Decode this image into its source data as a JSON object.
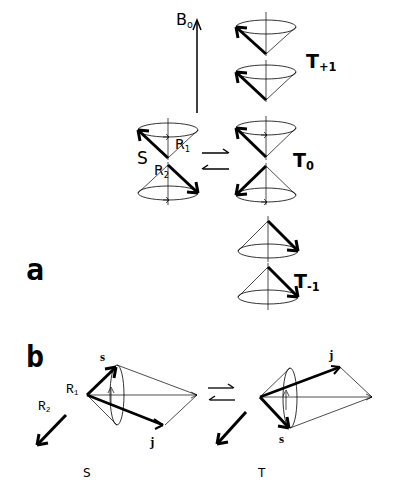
{
  "figure": {
    "panel_a": {
      "letter": "a",
      "field_label": "B",
      "field_sub": "o",
      "singlet_label": "S",
      "R1_label": "R",
      "R1_sub": "1",
      "R2_label": "R",
      "R2_sub": "2",
      "triplet_plus": {
        "label": "T",
        "sub": "+1"
      },
      "triplet_zero": {
        "label": "T",
        "sub": "0"
      },
      "triplet_minus": {
        "label": "T",
        "sub": "-1"
      }
    },
    "panel_b": {
      "letter": "b",
      "left": {
        "s_label": "s",
        "j_label": "j",
        "R1_label": "R",
        "R1_sub": "1",
        "R2_label": "R",
        "R2_sub": "2",
        "caption": "S"
      },
      "right": {
        "s_label": "s",
        "j_label": "j",
        "caption": "T"
      }
    },
    "colors": {
      "ink": "#000000",
      "background": "#ffffff"
    }
  }
}
